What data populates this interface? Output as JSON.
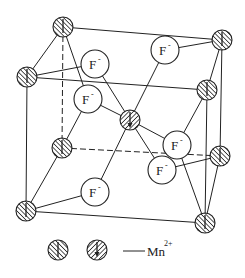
{
  "diagram": {
    "ions": {
      "anion_label": "F",
      "anion_charge": "-",
      "cation_label": "Mn",
      "cation_charge": "2+"
    },
    "legend": {
      "separator": "—",
      "text": "Mn",
      "superscript": "2+",
      "entries": [
        {
          "symbol": "hatched-circle-spin-up",
          "meaning": "Mn2+ spin up"
        },
        {
          "symbol": "hatched-circle-spin-down",
          "meaning": "Mn2+ spin down"
        }
      ]
    },
    "f_labels": [
      "F",
      "F",
      "F",
      "F",
      "F",
      "F"
    ],
    "f_superscript": "-",
    "colors": {
      "line": "#222222",
      "background": "#ffffff"
    }
  }
}
